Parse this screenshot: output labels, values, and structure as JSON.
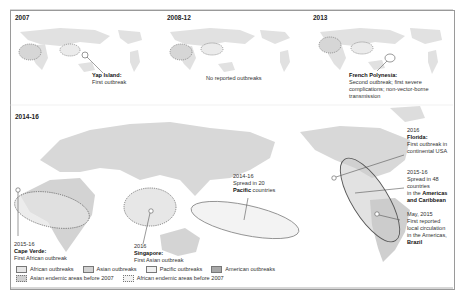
{
  "panels": [
    {
      "title": "2007",
      "annotations": [
        {
          "place": "Yap Island:",
          "text": "First outbreak"
        }
      ]
    },
    {
      "title": "2008-12",
      "annotations": [
        {
          "place": "",
          "text": "No reported outbreaks"
        }
      ]
    },
    {
      "title": "2013",
      "annotations": [
        {
          "place": "French Polynesia:",
          "text": "Second outbreak; first severe complications; non-vector-borne transmission",
          "lines": [
            "Second outbreak; first severe",
            "complications; non-vector-borne",
            "transmission"
          ]
        }
      ]
    }
  ],
  "main_panel": {
    "title": "2014-16",
    "annotations": {
      "cape_verde": {
        "year": "2015-16",
        "place": "Cape Verde:",
        "text": "First African outbreak"
      },
      "singapore": {
        "year": "2016",
        "place": "Singapore:",
        "text": "First Asian outbreak"
      },
      "pacific": {
        "line1": "2014-16",
        "line2": "Spread in 20",
        "bold": "Pacific",
        "rest": " countries"
      },
      "florida": {
        "year": "2016",
        "place": "Florida:",
        "line1": "First outbreak in",
        "line2": "continental USA"
      },
      "americas": {
        "line1": "2015-16",
        "line2": "Spread in 48",
        "line3": "countries",
        "line4_pre": "in the ",
        "line4_bold": "Americas",
        "line5_bold": "and Caribbean"
      },
      "brazil": {
        "line1": "May, 2015",
        "line2": "First reported",
        "line3": "local circulation",
        "line4": "in the Americas,",
        "place": "Brazil"
      }
    }
  },
  "legend": {
    "items": [
      {
        "label": "African outbreaks",
        "color": "#e6e6e6",
        "style": "solid"
      },
      {
        "label": "Asian outbreaks",
        "color": "#d2d2d2",
        "style": "solid"
      },
      {
        "label": "Pacific outbreaks",
        "color": "#efefef",
        "style": "solid"
      },
      {
        "label": "American outbreaks",
        "color": "#a8a8a8",
        "style": "solid"
      },
      {
        "label": "Asian endemic areas before 2007",
        "color": "#cfcfcf",
        "style": "dotted"
      },
      {
        "label": "African endemic areas before 2007",
        "color": "#f2f2f2",
        "style": "dotted"
      }
    ]
  },
  "colors": {
    "land": "#d9d9d9",
    "border": "#9a9a9a",
    "ellipse_stroke": "#666666"
  }
}
